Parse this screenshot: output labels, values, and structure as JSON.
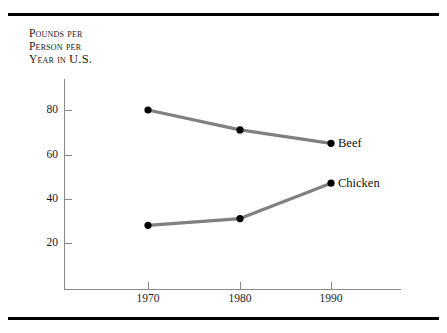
{
  "figure": {
    "background_color": "#ffffff",
    "rule_color": "#000000",
    "axis_color": "#8a8a8a",
    "line_color": "#808080",
    "marker_color": "#000000",
    "text_color": "#1b1b1b"
  },
  "axis_title": {
    "line1": "Pounds per",
    "line2": "Person per",
    "line3": "Year in ",
    "line3_emph": "U.S."
  },
  "chart_data": {
    "type": "line",
    "title": "",
    "subtitle": "",
    "xlabel": "",
    "ylabel": "Pounds per person per year in U.S.",
    "x": [
      1970,
      1980,
      1990
    ],
    "categories": [
      "1970",
      "1980",
      "1990"
    ],
    "series": [
      {
        "name": "Beef",
        "values": [
          80,
          71,
          65
        ],
        "color": "#808080",
        "marker_color": "#000000",
        "label": "Beef"
      },
      {
        "name": "Chicken",
        "values": [
          28,
          31,
          47
        ],
        "color": "#808080",
        "marker_color": "#000000",
        "label": "Chicken"
      }
    ],
    "xlim": [
      1965,
      1995
    ],
    "ylim": [
      0,
      90
    ],
    "yticks": [
      20,
      40,
      60,
      80
    ],
    "ytick_labels": [
      "20",
      "40",
      "60",
      "80"
    ],
    "xticks": [
      1970,
      1980,
      1990
    ],
    "xtick_labels": [
      "1970",
      "1980",
      "1990"
    ],
    "grid": false,
    "legend": "inline-right-of-last-point"
  },
  "ticks": {
    "y": [
      {
        "label": "80",
        "value": 80
      },
      {
        "label": "60",
        "value": 60
      },
      {
        "label": "40",
        "value": 40
      },
      {
        "label": "20",
        "value": 20
      }
    ],
    "x": [
      {
        "label": "1970",
        "value": 1970
      },
      {
        "label": "1980",
        "value": 1980
      },
      {
        "label": "1990",
        "value": 1990
      }
    ]
  }
}
